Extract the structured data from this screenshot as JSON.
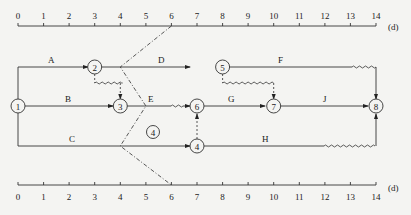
{
  "timescale": {
    "unit_label": "(d)",
    "ticks": [
      "0",
      "1",
      "2",
      "3",
      "4",
      "5",
      "6",
      "7",
      "8",
      "9",
      "10",
      "11",
      "12",
      "13",
      "14"
    ]
  },
  "nodes": [
    {
      "id": "1",
      "label": "1"
    },
    {
      "id": "2",
      "label": "2"
    },
    {
      "id": "3",
      "label": "3"
    },
    {
      "id": "4",
      "label": "4"
    },
    {
      "id": "5",
      "label": "5"
    },
    {
      "id": "6",
      "label": "6"
    },
    {
      "id": "7",
      "label": "7"
    },
    {
      "id": "8",
      "label": "8"
    }
  ],
  "activities": [
    {
      "name": "A",
      "from": "1",
      "to": "2"
    },
    {
      "name": "B",
      "from": "1",
      "to": "3"
    },
    {
      "name": "C",
      "from": "1",
      "to": "4"
    },
    {
      "name": "D",
      "from": "2",
      "to": "5"
    },
    {
      "name": "E",
      "from": "3",
      "to": "6"
    },
    {
      "name": "F",
      "from": "5",
      "to": "8"
    },
    {
      "name": "G",
      "from": "6",
      "to": "7"
    },
    {
      "name": "H",
      "from": "4",
      "to": "8"
    },
    {
      "name": "J",
      "from": "7",
      "to": "8"
    }
  ],
  "check_line_marker": "4"
}
